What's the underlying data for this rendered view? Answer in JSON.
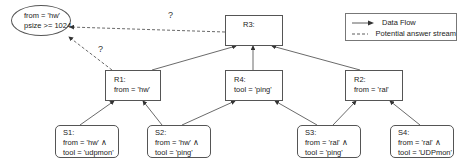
{
  "query": {
    "lines": [
      "from = 'hw'",
      "psize >= 1024"
    ]
  },
  "legend": {
    "items": [
      {
        "label": "Data Flow",
        "style": "solid"
      },
      {
        "label": "Potential answer stream",
        "style": "dashed"
      }
    ]
  },
  "annotations": {
    "question_top": "?",
    "question_left": "?"
  },
  "nodes": {
    "R3": {
      "title": "R3:",
      "lines": []
    },
    "R1": {
      "title": "R1:",
      "lines": [
        "from = 'hw'"
      ]
    },
    "R4": {
      "title": "R4:",
      "lines": [
        "tool = 'ping'"
      ]
    },
    "R2": {
      "title": "R2:",
      "lines": [
        "from = 'ral'"
      ]
    },
    "S1": {
      "title": "S1:",
      "lines": [
        "from = 'hw' ∧",
        "tool = 'udpmon'"
      ]
    },
    "S2": {
      "title": "S2:",
      "lines": [
        "from = 'hw' ∧",
        "tool = 'ping'"
      ]
    },
    "S3": {
      "title": "S3:",
      "lines": [
        "from = 'ral' ∧",
        "tool = 'ping'"
      ]
    },
    "S4": {
      "title": "S4:",
      "lines": [
        "from = 'ral' ∧",
        "tool = 'UDPmon'"
      ]
    }
  },
  "edges": {
    "data_flow": [
      [
        "S1",
        "R1"
      ],
      [
        "S2",
        "R1"
      ],
      [
        "S2",
        "R4"
      ],
      [
        "S3",
        "R4"
      ],
      [
        "S3",
        "R2"
      ],
      [
        "S4",
        "R2"
      ],
      [
        "R1",
        "R3"
      ],
      [
        "R4",
        "R3"
      ],
      [
        "R2",
        "R3"
      ]
    ],
    "potential_answer": [
      [
        "R3",
        "query"
      ],
      [
        "R1",
        "query"
      ]
    ]
  },
  "colors": {
    "line": "#444444",
    "border": "#555555"
  }
}
